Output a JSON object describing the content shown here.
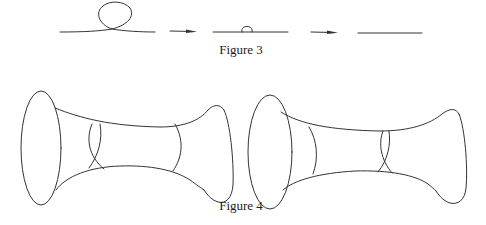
{
  "figures": [
    {
      "id": "figure-3",
      "caption": "Figure 3",
      "panels": [
        "curve with large loop",
        "curve with small loop",
        "straight curve"
      ],
      "arrows": 2
    },
    {
      "id": "figure-4",
      "caption": "Figure 4",
      "panels": [
        "surface with crossed cross-sections near left end",
        "surface with crossed cross-sections near right end"
      ]
    }
  ],
  "colors": {
    "stroke": "#333333",
    "background": "#ffffff",
    "text": "#222222"
  }
}
